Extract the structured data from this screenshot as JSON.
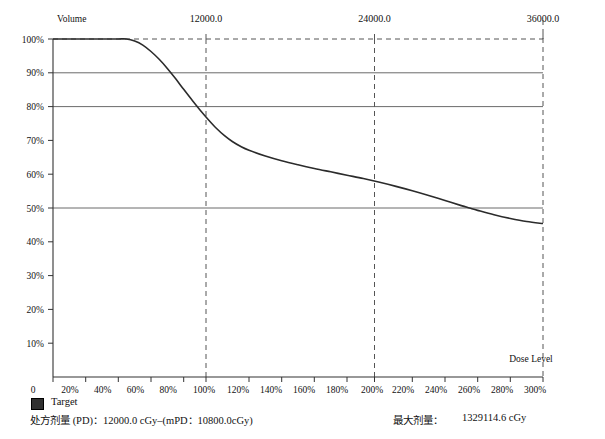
{
  "chart_data": {
    "type": "line",
    "title": "",
    "xlabel": "Dose Level",
    "ylabel": "Volume",
    "xlim": [
      0,
      300
    ],
    "ylim": [
      0,
      100
    ],
    "grid": true,
    "legend_position": "bottom-left",
    "x_tick_labels": [
      "0",
      "20%",
      "40%",
      "60%",
      "80%",
      "100%",
      "120%",
      "140%",
      "160%",
      "180%",
      "200%",
      "220%",
      "240%",
      "260%",
      "280%",
      "300%"
    ],
    "x_tick_values": [
      0,
      20,
      40,
      60,
      80,
      100,
      120,
      140,
      160,
      180,
      200,
      220,
      240,
      260,
      280,
      300
    ],
    "y_tick_labels": [
      "0",
      "10%",
      "20%",
      "30%",
      "40%",
      "50%",
      "60%",
      "70%",
      "80%",
      "90%",
      "100%"
    ],
    "y_tick_values": [
      0,
      10,
      20,
      30,
      40,
      50,
      60,
      70,
      80,
      90,
      100
    ],
    "top_axis_labels": [
      "12000.0",
      "24000.0",
      "36000.0"
    ],
    "top_axis_values": [
      100,
      200,
      300
    ],
    "reference_lines_y": [
      90,
      80,
      50
    ],
    "dashed_guides_x": [
      100,
      200,
      300
    ],
    "dashed_guide_y": 100,
    "series": [
      {
        "name": "Target",
        "color": "#2b2b2b",
        "points": [
          [
            0,
            100
          ],
          [
            10,
            100
          ],
          [
            20,
            100
          ],
          [
            30,
            100
          ],
          [
            40,
            100
          ],
          [
            45,
            100
          ],
          [
            50,
            99.4
          ],
          [
            55,
            98.2
          ],
          [
            60,
            96.3
          ],
          [
            65,
            94.0
          ],
          [
            70,
            91.3
          ],
          [
            75,
            88.3
          ],
          [
            80,
            85.1
          ],
          [
            85,
            82.0
          ],
          [
            90,
            79.0
          ],
          [
            95,
            76.2
          ],
          [
            100,
            73.6
          ],
          [
            105,
            71.4
          ],
          [
            110,
            69.6
          ],
          [
            115,
            68.2
          ],
          [
            120,
            67.1
          ],
          [
            130,
            65.4
          ],
          [
            140,
            64.0
          ],
          [
            150,
            62.8
          ],
          [
            160,
            61.7
          ],
          [
            170,
            60.7
          ],
          [
            180,
            59.7
          ],
          [
            190,
            58.7
          ],
          [
            200,
            57.6
          ],
          [
            210,
            56.4
          ],
          [
            220,
            55.1
          ],
          [
            230,
            53.7
          ],
          [
            240,
            52.2
          ],
          [
            250,
            50.7
          ],
          [
            255,
            50.0
          ],
          [
            260,
            49.3
          ],
          [
            270,
            48.0
          ],
          [
            280,
            46.9
          ],
          [
            290,
            46.0
          ],
          [
            300,
            45.4
          ]
        ]
      }
    ]
  },
  "legend": {
    "label": "Target",
    "swatch_color": "#303030"
  },
  "footer": {
    "prescription_dose": "处方剂量 (PD)：12000.0 cGy–(mPD：10800.0cGy)",
    "max_dose_label": "最大剂量：",
    "max_dose_value": "1329114.6 cGy"
  }
}
